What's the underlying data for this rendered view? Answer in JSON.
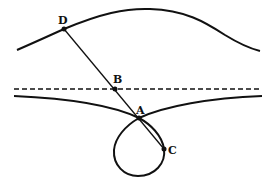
{
  "diagram": {
    "labels": {
      "D": "D",
      "B": "B",
      "A": "A",
      "C": "C"
    },
    "colors": {
      "stroke": "#111111",
      "background": "#ffffff"
    },
    "points": {
      "D": [
        64,
        29
      ],
      "B": [
        115,
        89
      ],
      "A": [
        139,
        118
      ],
      "C": [
        164,
        149
      ]
    }
  }
}
